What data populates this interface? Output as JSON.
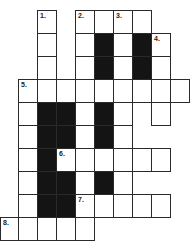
{
  "puzzle": {
    "type": "crossword",
    "cell_width": 19,
    "cell_height": 23,
    "origin_x": 0,
    "origin_y": 10,
    "colors": {
      "white": "#ffffff",
      "black": "#141414",
      "border": "#2a2a2a"
    },
    "cells": [
      {
        "r": 0,
        "c": 2,
        "num": "1."
      },
      {
        "r": 0,
        "c": 4,
        "num": "2."
      },
      {
        "r": 0,
        "c": 5
      },
      {
        "r": 0,
        "c": 6,
        "num": "3."
      },
      {
        "r": 0,
        "c": 7
      },
      {
        "r": 1,
        "c": 2
      },
      {
        "r": 1,
        "c": 4
      },
      {
        "r": 1,
        "c": 5,
        "black": true
      },
      {
        "r": 1,
        "c": 6
      },
      {
        "r": 1,
        "c": 7,
        "black": true
      },
      {
        "r": 1,
        "c": 8,
        "num": "4."
      },
      {
        "r": 2,
        "c": 2
      },
      {
        "r": 2,
        "c": 4
      },
      {
        "r": 2,
        "c": 5,
        "black": true
      },
      {
        "r": 2,
        "c": 6
      },
      {
        "r": 2,
        "c": 7,
        "black": true
      },
      {
        "r": 2,
        "c": 8
      },
      {
        "r": 3,
        "c": 1,
        "num": "5."
      },
      {
        "r": 3,
        "c": 2
      },
      {
        "r": 3,
        "c": 3
      },
      {
        "r": 3,
        "c": 4
      },
      {
        "r": 3,
        "c": 5
      },
      {
        "r": 3,
        "c": 6
      },
      {
        "r": 3,
        "c": 7
      },
      {
        "r": 3,
        "c": 8
      },
      {
        "r": 3,
        "c": 9
      },
      {
        "r": 4,
        "c": 1
      },
      {
        "r": 4,
        "c": 2,
        "black": true
      },
      {
        "r": 4,
        "c": 3,
        "black": true
      },
      {
        "r": 4,
        "c": 4
      },
      {
        "r": 4,
        "c": 5,
        "black": true
      },
      {
        "r": 4,
        "c": 6
      },
      {
        "r": 4,
        "c": 8
      },
      {
        "r": 5,
        "c": 1
      },
      {
        "r": 5,
        "c": 2,
        "black": true
      },
      {
        "r": 5,
        "c": 3,
        "black": true
      },
      {
        "r": 5,
        "c": 4
      },
      {
        "r": 5,
        "c": 5,
        "black": true
      },
      {
        "r": 5,
        "c": 6
      },
      {
        "r": 6,
        "c": 1
      },
      {
        "r": 6,
        "c": 2,
        "black": true
      },
      {
        "r": 6,
        "c": 3,
        "num": "6."
      },
      {
        "r": 6,
        "c": 4
      },
      {
        "r": 6,
        "c": 5
      },
      {
        "r": 6,
        "c": 6
      },
      {
        "r": 6,
        "c": 7
      },
      {
        "r": 6,
        "c": 8
      },
      {
        "r": 7,
        "c": 1
      },
      {
        "r": 7,
        "c": 2,
        "black": true
      },
      {
        "r": 7,
        "c": 3,
        "black": true
      },
      {
        "r": 7,
        "c": 4
      },
      {
        "r": 7,
        "c": 5,
        "black": true
      },
      {
        "r": 7,
        "c": 6
      },
      {
        "r": 8,
        "c": 1
      },
      {
        "r": 8,
        "c": 2,
        "black": true
      },
      {
        "r": 8,
        "c": 3,
        "black": true
      },
      {
        "r": 8,
        "c": 4,
        "num": "7."
      },
      {
        "r": 8,
        "c": 5
      },
      {
        "r": 8,
        "c": 6
      },
      {
        "r": 8,
        "c": 7
      },
      {
        "r": 8,
        "c": 8
      },
      {
        "r": 9,
        "c": 0,
        "num": "8."
      },
      {
        "r": 9,
        "c": 1
      },
      {
        "r": 9,
        "c": 2
      },
      {
        "r": 9,
        "c": 3
      },
      {
        "r": 9,
        "c": 4
      }
    ]
  }
}
